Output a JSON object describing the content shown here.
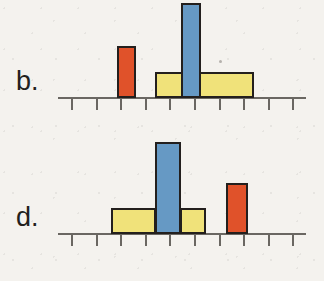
{
  "figure": {
    "background_color": "#f4f2ee",
    "outline_color": "#231f1d",
    "axis_color": "#6a6762",
    "panels": [
      {
        "label": "b.",
        "label_x": 16,
        "label_y": 68,
        "axis": {
          "x": 58,
          "y": 97,
          "width": 248,
          "tick_length": 11,
          "tick_count": 10,
          "tick_spacing": 24.6,
          "tick_start_x": 71
        },
        "bars": [
          {
            "color_name": "red",
            "color": "#e0522a",
            "x": 117,
            "width": 19,
            "height": 52,
            "cells": 1
          },
          {
            "color_name": "yellow",
            "color": "#f0e27a",
            "x": 155,
            "width": 99,
            "height": 26,
            "cells": 4
          },
          {
            "color_name": "blue",
            "color": "#6699c4",
            "x": 181,
            "width": 20,
            "height": 95,
            "cells": 1
          }
        ],
        "specks": [
          {
            "x": 219,
            "y": 60
          }
        ]
      },
      {
        "label": "d.",
        "label_x": 16,
        "label_y": 204,
        "axis": {
          "x": 58,
          "y": 233,
          "width": 248,
          "tick_length": 11,
          "tick_count": 10,
          "tick_spacing": 24.6,
          "tick_start_x": 71
        },
        "bars": [
          {
            "color_name": "yellow",
            "color": "#f0e27a",
            "x": 111,
            "width": 45,
            "height": 26,
            "cells": 2
          },
          {
            "color_name": "yellow",
            "color": "#f0e27a",
            "x": 180,
            "width": 26,
            "height": 26,
            "cells": 1
          },
          {
            "color_name": "blue",
            "color": "#6699c4",
            "x": 155,
            "width": 26,
            "height": 92,
            "cells": 1
          },
          {
            "color_name": "red",
            "color": "#e0522a",
            "x": 226,
            "width": 22,
            "height": 51,
            "cells": 1
          }
        ],
        "specks": []
      }
    ]
  },
  "chart_data": {
    "type": "bar",
    "title": "",
    "xlabel": "",
    "ylabel": "",
    "grid": false,
    "legend": "none",
    "note": "Two stacked panels labeled b. and d. Each panel is a bar diagram on a tick-marked horizontal axis with no numeric labels. Bar widths span whole numbers of axis cells. Heights read in axis-cell units (1 cell ~ 24.6 px wide, short bars ~1 cell tall, tall bars ~4 cells tall).",
    "panels": [
      {
        "label": "b.",
        "axis_range": [
          0,
          10
        ],
        "axis_tick_labels": [],
        "bars": [
          {
            "color": "red",
            "start_cell": 2,
            "end_cell": 3,
            "width_cells": 1,
            "height_units": 2.1
          },
          {
            "color": "yellow",
            "start_cell": 4,
            "end_cell": 8,
            "width_cells": 4,
            "height_units": 1.1
          },
          {
            "color": "blue",
            "start_cell": 5,
            "end_cell": 6,
            "width_cells": 1,
            "height_units": 3.9
          }
        ]
      },
      {
        "label": "d.",
        "axis_range": [
          0,
          10
        ],
        "axis_tick_labels": [],
        "bars": [
          {
            "color": "yellow",
            "start_cell": 2,
            "end_cell": 4,
            "width_cells": 2,
            "height_units": 1.1
          },
          {
            "color": "blue",
            "start_cell": 4,
            "end_cell": 5,
            "width_cells": 1,
            "height_units": 3.7
          },
          {
            "color": "yellow",
            "start_cell": 5,
            "end_cell": 6,
            "width_cells": 1,
            "height_units": 1.1
          },
          {
            "color": "red",
            "start_cell": 7,
            "end_cell": 8,
            "width_cells": 1,
            "height_units": 2.1
          }
        ]
      }
    ],
    "palette": {
      "red": "#e0522a",
      "yellow": "#f0e27a",
      "blue": "#6699c4",
      "outline": "#231f1d",
      "axis": "#6a6762",
      "background": "#f4f2ee"
    }
  }
}
